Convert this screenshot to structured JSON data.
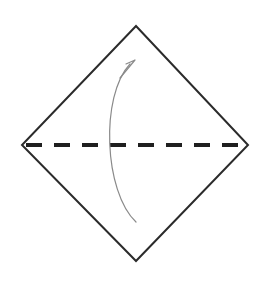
{
  "figure": {
    "kind": "origami-fold-diagram",
    "canvas": {
      "width": 269,
      "height": 281,
      "background": "#ffffff"
    }
  },
  "paper": {
    "name": "square-sheet-rotated-45",
    "shape": "diamond",
    "stroke_color": "#2b2b2b",
    "stroke_width": 2,
    "fill_color": "#ffffff",
    "vertices": {
      "top": {
        "x": 136,
        "y": 26
      },
      "right": {
        "x": 248,
        "y": 145
      },
      "bottom": {
        "x": 136,
        "y": 261
      },
      "left": {
        "x": 22,
        "y": 145
      }
    },
    "points_path": "136,26 248,145 136,261 22,145"
  },
  "fold_line": {
    "name": "horizontal-valley-fold",
    "style": "dashed",
    "stroke_color": "#1f1f1f",
    "stroke_width": 4,
    "dash_length": 16,
    "gap_length": 12,
    "start": {
      "x": 26,
      "y": 145
    },
    "end": {
      "x": 244,
      "y": 145
    }
  },
  "fold_arrow": {
    "name": "fold-direction-arrow",
    "direction": "bottom-to-top",
    "stroke_color": "#8a8a8a",
    "stroke_width": 1.2,
    "curve_path": "M 136 222 C 104 192 100 96 130 64",
    "arrowhead": {
      "style": "open-v",
      "tip": {
        "x": 135,
        "y": 60
      },
      "path": "M 120 78 L 135 60 M 126 64 L 135 60"
    }
  }
}
